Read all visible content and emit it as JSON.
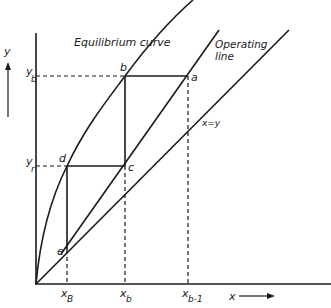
{
  "diagram": {
    "axes": {
      "y_label": "y",
      "x_label": "x"
    },
    "curves": {
      "equilibrium": "Equilibrium curve",
      "operating_line_1": "Operating",
      "operating_line_2": "line",
      "diagonal": "x=y"
    },
    "points": {
      "a": "a",
      "b": "b",
      "c": "c",
      "d": "d",
      "e": "e"
    },
    "y_ticks": {
      "yb_main": "y",
      "yb_sub": "b",
      "yr_main": "y",
      "yr_sub": "r"
    },
    "x_ticks": {
      "xB_main": "x",
      "xB_sub": "B",
      "xb_main": "x",
      "xb_sub": "b",
      "xb1_main": "x",
      "xb1_sub": "b-1"
    }
  },
  "colors": {
    "ink": "#1a1a1a",
    "background": "#ffffff"
  }
}
